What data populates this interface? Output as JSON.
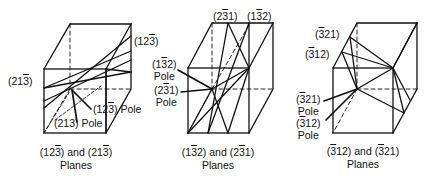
{
  "figures": [
    {
      "id": "cube-1",
      "planes_caption": [
        "(12",
        "3",
        ") and (21",
        "3",
        ")"
      ],
      "caption_line2": "Planes",
      "labels": {
        "plane_a": [
          "(12",
          "3",
          ")"
        ],
        "plane_b": [
          "(21",
          "3",
          ")"
        ],
        "pole_a": [
          "(12",
          "3",
          ") Pole"
        ],
        "pole_b": "(213) Pole"
      }
    },
    {
      "id": "cube-2",
      "planes_caption": [
        "(1",
        "3",
        "2) and (2",
        "3",
        "1)"
      ],
      "caption_line2": "Planes",
      "labels": {
        "plane_a": [
          "(2",
          "3",
          "1)"
        ],
        "plane_b": [
          "(1",
          "3",
          "2)"
        ],
        "pole_a": [
          "(1",
          "3",
          "2)"
        ],
        "pole_a2": "Pole",
        "pole_b": [
          "(2",
          "3",
          "1)"
        ],
        "pole_b2": "Pole"
      }
    },
    {
      "id": "cube-3",
      "planes_caption": [
        "(",
        "3",
        "12) and (",
        "3",
        "21)"
      ],
      "caption_line2": "Planes",
      "labels": {
        "plane_a": [
          "(",
          "3",
          "21)"
        ],
        "plane_b": [
          "(",
          "3",
          "12)"
        ],
        "pole_a": [
          "(",
          "3",
          "21)"
        ],
        "pole_a2": "Pole",
        "pole_b": [
          "(",
          "3",
          "12)"
        ],
        "pole_b2": "Pole"
      }
    }
  ]
}
